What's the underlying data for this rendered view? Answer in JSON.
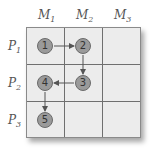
{
  "columns": [
    {
      "base": "M",
      "sub": "1"
    },
    {
      "base": "M",
      "sub": "2"
    },
    {
      "base": "M",
      "sub": "3"
    }
  ],
  "rows": [
    {
      "base": "P",
      "sub": "1"
    },
    {
      "base": "P",
      "sub": "2"
    },
    {
      "base": "P",
      "sub": "3"
    }
  ],
  "nodes": [
    {
      "label": "1",
      "row": 1,
      "col": 1
    },
    {
      "label": "2",
      "row": 1,
      "col": 2
    },
    {
      "label": "3",
      "row": 2,
      "col": 2
    },
    {
      "label": "4",
      "row": 2,
      "col": 1
    },
    {
      "label": "5",
      "row": 3,
      "col": 1
    }
  ],
  "edges": [
    {
      "from": "1",
      "to": "2"
    },
    {
      "from": "2",
      "to": "3"
    },
    {
      "from": "3",
      "to": "4"
    },
    {
      "from": "4",
      "to": "5"
    }
  ],
  "colors": {
    "cell_fill": "#ececec",
    "grid_line": "#6f6f6f",
    "node_fill": "#9a9a9a",
    "node_border": "#6a6a6a",
    "arrow": "#555555"
  }
}
